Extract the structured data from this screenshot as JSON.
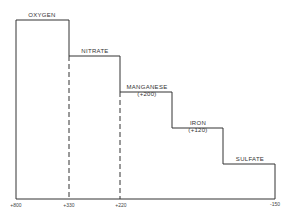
{
  "diagram": {
    "type": "redox-ladder",
    "steps": [
      {
        "name": "OXYGEN",
        "value": ""
      },
      {
        "name": "NITRATE",
        "value": ""
      },
      {
        "name": "MANGANESE",
        "value": "(+200)"
      },
      {
        "name": "IRON",
        "value": "(+120)"
      },
      {
        "name": "SULFATE",
        "value": ""
      }
    ],
    "axis_ticks": [
      "+800",
      "+330",
      "+220",
      "-150"
    ]
  }
}
